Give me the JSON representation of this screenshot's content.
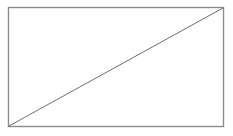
{
  "figure": {
    "title": "Rectangle with diagonal",
    "canvas": {
      "width": 233,
      "height": 136,
      "background_color": "#ffffff"
    },
    "shapes": [
      {
        "name": "rectangle",
        "type": "rect",
        "x": 8.5,
        "y": 7.5,
        "width": 215,
        "height": 119,
        "fill_color": "#ffffff",
        "stroke_color": "#8c8c8c",
        "stroke_width": 1.4
      },
      {
        "name": "diagonal",
        "type": "line",
        "x1": 9,
        "y1": 126,
        "x2": 223,
        "y2": 8,
        "stroke_color": "#6e6e6e",
        "stroke_width": 1
      }
    ]
  },
  "chart_data": {
    "type": "line",
    "title": "Rectangle with diagonal",
    "subtitle": "",
    "xlabel": "",
    "ylabel": "",
    "x": [
      0,
      1
    ],
    "series": [
      {
        "name": "diagonal",
        "values": [
          0,
          1
        ]
      }
    ],
    "xlim": [
      0,
      1
    ],
    "ylim": [
      0,
      1
    ],
    "grid": false,
    "legend": "none",
    "tick_labels_x": [],
    "tick_labels_y": [],
    "annotations": []
  }
}
